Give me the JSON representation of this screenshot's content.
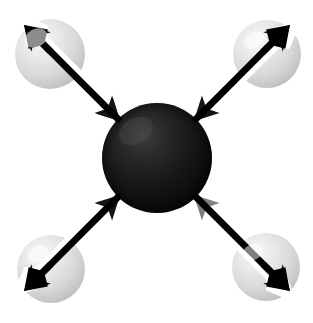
{
  "figure": {
    "title": "Tetrahedral molecule symmetric stretch vibration diagram",
    "caption": "",
    "background_color": "#ffffff",
    "width": 313,
    "height": 323
  },
  "colors": {
    "background": "#ffffff",
    "central_atom_dark": "#0a0a0a",
    "central_atom_mid": "#232323",
    "central_atom_highlight": "#4a4a4a",
    "outer_atom_light": "#efefef",
    "outer_atom_mid": "#d6d6d6",
    "outer_atom_shadow": "#b4b4b4",
    "arrow_black": "#000000",
    "arrow_edge_white": "#f2f2f2"
  },
  "central_atom": {
    "label": "central-atom",
    "cx": 157,
    "cy": 158,
    "r": 55,
    "shade": "dark"
  },
  "outer_atoms": [
    {
      "label": "outer-atom-top-left",
      "cx": 50,
      "cy": 54,
      "r": 35,
      "shade": "light"
    },
    {
      "label": "outer-atom-top-right",
      "cx": 267,
      "cy": 54,
      "r": 34,
      "shade": "light"
    },
    {
      "label": "outer-atom-bottom-left",
      "cx": 51,
      "cy": 269,
      "r": 34,
      "shade": "light"
    },
    {
      "label": "outer-atom-bottom-right",
      "cx": 266,
      "cy": 267,
      "r": 34,
      "shade": "light"
    }
  ],
  "bond_arrows": [
    {
      "label": "bond-arrow-top-left",
      "direction": "up-left",
      "outer_tip": {
        "x": 26,
        "y": 30
      },
      "inner_tip": {
        "x": 136,
        "y": 140
      },
      "shaft_width": 7,
      "double_headed": true
    },
    {
      "label": "bond-arrow-top-right",
      "direction": "up-right",
      "outer_tip": {
        "x": 288,
        "y": 29
      },
      "inner_tip": {
        "x": 180,
        "y": 138
      },
      "shaft_width": 7,
      "double_headed": true
    },
    {
      "label": "bond-arrow-bottom-left",
      "direction": "down-left",
      "outer_tip": {
        "x": 27,
        "y": 293
      },
      "inner_tip": {
        "x": 135,
        "y": 182
      },
      "shaft_width": 7,
      "double_headed": true
    },
    {
      "label": "bond-arrow-bottom-right",
      "direction": "down-right",
      "outer_tip": {
        "x": 288,
        "y": 292
      },
      "inner_tip": {
        "x": 180,
        "y": 180
      },
      "shaft_width": 7,
      "double_headed": true
    }
  ],
  "annotations": {
    "arrow_count": 4,
    "atom_count": 5,
    "geometry": "tetrahedral"
  }
}
